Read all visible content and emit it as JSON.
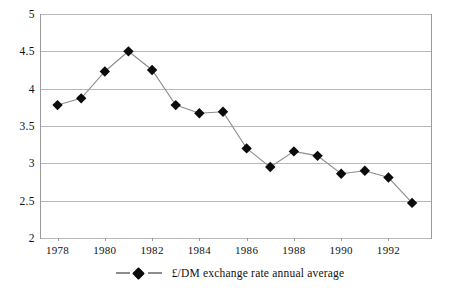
{
  "chart_data": {
    "type": "line",
    "title": "",
    "subtitle": "",
    "xlabel": "",
    "ylabel": "",
    "x": [
      1978,
      1979,
      1980,
      1981,
      1982,
      1983,
      1984,
      1985,
      1986,
      1987,
      1988,
      1989,
      1990,
      1991,
      1992,
      1993
    ],
    "series": [
      {
        "name": "£/DM exchange rate annual average",
        "marker": "diamond",
        "marker_color": "#0b0b0b",
        "line_color": "#8d8d8d",
        "values": [
          3.78,
          3.87,
          4.23,
          4.5,
          4.25,
          3.78,
          3.67,
          3.69,
          3.2,
          2.95,
          3.16,
          3.1,
          2.86,
          2.9,
          2.81,
          2.47
        ]
      }
    ],
    "xlim": [
      1977.3,
      1993.8
    ],
    "ylim": [
      2,
      5
    ],
    "yticks": [
      2,
      2.5,
      3,
      3.5,
      4,
      4.5,
      5
    ],
    "ytick_labels": [
      "2",
      "2.5",
      "3",
      "3.5",
      "4",
      "4.5",
      "5"
    ],
    "xticks": [
      1978,
      1980,
      1982,
      1984,
      1986,
      1988,
      1990,
      1992
    ],
    "xtick_labels": [
      "1978",
      "1980",
      "1982",
      "1984",
      "1986",
      "1988",
      "1990",
      "1992"
    ],
    "grid": true,
    "grid_axis": "y",
    "grid_color": "#b9b9b9",
    "legend": {
      "position": "bottom",
      "entries": [
        {
          "label": "£/DM exchange rate annual average",
          "marker": "diamond"
        }
      ]
    },
    "frame": {
      "left_border": true,
      "right_border": true,
      "bottom_border": true,
      "top_border": false,
      "color": "#9a9a9a"
    }
  }
}
